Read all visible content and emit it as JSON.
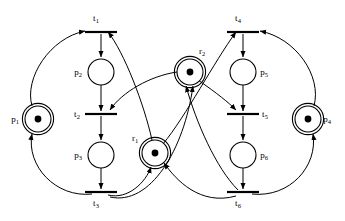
{
  "diagram": {
    "type": "petri-net",
    "width": 345,
    "height": 221,
    "background_color": "#ffffff",
    "stroke_color": "#000000"
  },
  "places": [
    {
      "id": "p1",
      "label": "p",
      "sub": "1",
      "cx": 38,
      "cy": 119,
      "r": 13,
      "tokens": 1,
      "double_circle": true,
      "label_x": 15,
      "label_y": 122
    },
    {
      "id": "p2",
      "label": "p",
      "sub": "2",
      "cx": 101,
      "cy": 72,
      "r": 13,
      "tokens": 0,
      "double_circle": false,
      "label_x": 78,
      "label_y": 75
    },
    {
      "id": "p3",
      "label": "p",
      "sub": "3",
      "cx": 101,
      "cy": 155,
      "r": 13,
      "tokens": 0,
      "double_circle": false,
      "label_x": 78,
      "label_y": 158
    },
    {
      "id": "p4",
      "label": "p",
      "sub": "4",
      "cx": 308,
      "cy": 119,
      "r": 13,
      "tokens": 1,
      "double_circle": true,
      "label_x": 327,
      "label_y": 122
    },
    {
      "id": "p5",
      "label": "p",
      "sub": "5",
      "cx": 243,
      "cy": 72,
      "r": 13,
      "tokens": 0,
      "double_circle": false,
      "label_x": 264,
      "label_y": 75
    },
    {
      "id": "p6",
      "label": "p",
      "sub": "6",
      "cx": 243,
      "cy": 155,
      "r": 13,
      "tokens": 0,
      "double_circle": false,
      "label_x": 264,
      "label_y": 158
    },
    {
      "id": "r1",
      "label": "r",
      "sub": "1",
      "cx": 155,
      "cy": 153,
      "r": 13,
      "tokens": 1,
      "double_circle": true,
      "label_x": 135,
      "label_y": 141
    },
    {
      "id": "r2",
      "label": "r",
      "sub": "2",
      "cx": 190,
      "cy": 72,
      "r": 13,
      "tokens": 1,
      "double_circle": true,
      "label_x": 202,
      "label_y": 54
    }
  ],
  "transitions": [
    {
      "id": "t1",
      "label": "t",
      "sub": "1",
      "cx": 101,
      "cy": 32,
      "half_width": 16,
      "label_x": 96,
      "label_y": 21
    },
    {
      "id": "t2",
      "label": "t",
      "sub": "2",
      "cx": 101,
      "cy": 114,
      "half_width": 16,
      "label_x": 77,
      "label_y": 117
    },
    {
      "id": "t3",
      "label": "t",
      "sub": "3",
      "cx": 101,
      "cy": 192,
      "half_width": 16,
      "label_x": 96,
      "label_y": 206
    },
    {
      "id": "t4",
      "label": "t",
      "sub": "4",
      "cx": 243,
      "cy": 32,
      "half_width": 16,
      "label_x": 238,
      "label_y": 21
    },
    {
      "id": "t5",
      "label": "t",
      "sub": "5",
      "cx": 243,
      "cy": 114,
      "half_width": 16,
      "label_x": 265,
      "label_y": 117
    },
    {
      "id": "t6",
      "label": "t",
      "sub": "6",
      "cx": 243,
      "cy": 192,
      "half_width": 16,
      "label_x": 238,
      "label_y": 206
    }
  ],
  "arcs": [
    {
      "from": "p1",
      "to": "t1",
      "kind": "curve",
      "d": "M 32 106 C 24 78 50 38 85 31",
      "name": "arc-p1-t1"
    },
    {
      "from": "t1",
      "to": "p2",
      "kind": "straight",
      "d": "M 101 34 L 101 57",
      "name": "arc-t1-p2"
    },
    {
      "from": "p2",
      "to": "t2",
      "kind": "straight",
      "d": "M 101 85 L 101 111",
      "name": "arc-t2-p2"
    },
    {
      "from": "t2",
      "to": "p3",
      "kind": "straight",
      "d": "M 101 116 L 101 140",
      "name": "arc-t2-p3"
    },
    {
      "from": "p3",
      "to": "t3",
      "kind": "straight",
      "d": "M 101 168 L 101 189",
      "name": "arc-p3-t3"
    },
    {
      "from": "t3",
      "to": "p1",
      "kind": "curve",
      "d": "M 92 194 C 56 198 26 166 32 134",
      "name": "arc-t3-p1"
    },
    {
      "from": "t4",
      "to": "p5",
      "kind": "straight",
      "d": "M 243 34 L 243 57",
      "name": "arc-t4-p5"
    },
    {
      "from": "p5",
      "to": "t5",
      "kind": "straight",
      "d": "M 243 85 L 243 111",
      "name": "arc-p5-t5"
    },
    {
      "from": "t5",
      "to": "p6",
      "kind": "straight",
      "d": "M 243 116 L 243 140",
      "name": "arc-t5-p6"
    },
    {
      "from": "p6",
      "to": "t6",
      "kind": "straight",
      "d": "M 243 168 L 243 189",
      "name": "arc-p6-t6"
    },
    {
      "from": "p4",
      "to": "t4",
      "kind": "curve",
      "d": "M 314 106 C 322 76 296 38 260 31",
      "name": "arc-p4-t4"
    },
    {
      "from": "t6",
      "to": "p4",
      "kind": "curve",
      "d": "M 252 194 C 290 198 318 166 313 134",
      "name": "arc-t6-p4"
    },
    {
      "from": "r1",
      "to": "t1",
      "kind": "curve",
      "d": "M 152 140 C 144 104 124 52 108 32",
      "name": "arc-r1-t1"
    },
    {
      "from": "r2",
      "to": "t2",
      "kind": "curve",
      "d": "M 177 72 C 150 76 122 92 110 110",
      "name": "arc-r2-t2"
    },
    {
      "from": "t3",
      "to": "r1",
      "kind": "curve",
      "d": "M 108 195 C 128 200 146 182 151 167",
      "name": "arc-t3-r1"
    },
    {
      "from": "t6",
      "to": "r2",
      "kind": "curve",
      "d": "M 238 190 C 216 168 196 122 186 86",
      "name": "arc-t6-r2"
    },
    {
      "from": "r2",
      "to": "t5",
      "kind": "curve",
      "d": "M 198 80 C 218 94 228 102 236 110",
      "name": "arc-r2-t5"
    },
    {
      "from": "r1",
      "to": "t4",
      "kind": "curve",
      "d": "M 163 144 C 186 116 214 62 236 32",
      "name": "arc-r1-t4"
    },
    {
      "from": "t3",
      "to": "r2",
      "kind": "curve",
      "d": "M 110 197 C 150 206 184 150 193 86",
      "name": "arc-t3-r2"
    },
    {
      "from": "t6",
      "to": "r1",
      "kind": "curve",
      "d": "M 236 196 C 200 206 176 180 164 163",
      "name": "arc-t6-r1"
    }
  ],
  "legend": {
    "place_count": 8,
    "transition_count": 6,
    "token_places": [
      "p1",
      "p4",
      "r1",
      "r2"
    ],
    "total_tokens": 4
  }
}
